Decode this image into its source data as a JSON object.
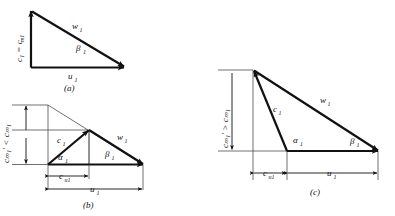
{
  "figure": {
    "stroke_color": "#111111",
    "ghost_color": "#333333",
    "background": "#ffffff"
  },
  "panels": [
    {
      "id": "a",
      "caption": "(a)",
      "labels": {
        "vertical": "c₁ = c",
        "vertical_sub": "m1",
        "relative_velocity": "w",
        "relative_velocity_sub": "1",
        "blade_speed": "u",
        "blade_speed_sub": "1",
        "relative_angle": "β",
        "relative_angle_sub": "1"
      }
    },
    {
      "id": "b",
      "caption": "(b)",
      "labels": {
        "vertical": "c",
        "vertical_sub_a": "m1",
        "vertical_prime": "′ <",
        "vertical_sub_b": "c",
        "vertical_sub_c": "m1",
        "inequality": "cₘ₁′ < cₘ₁",
        "absolute_velocity": "c",
        "absolute_velocity_sub": "1",
        "relative_velocity": "w",
        "relative_velocity_sub": "1",
        "blade_speed": "u",
        "blade_speed_sub": "1",
        "tangential": "c",
        "tangential_sub": "u1",
        "absolute_angle": "α",
        "absolute_angle_sub": "1",
        "relative_angle": "β",
        "relative_angle_sub": "1"
      }
    },
    {
      "id": "c",
      "caption": "(c)",
      "labels": {
        "inequality": "cₘ₁′ > cₘ₁",
        "absolute_velocity": "c",
        "absolute_velocity_sub": "1",
        "relative_velocity": "w",
        "relative_velocity_sub": "1",
        "blade_speed": "u",
        "blade_speed_sub": "1",
        "tangential": "c",
        "tangential_sub": "u1",
        "absolute_angle": "α",
        "absolute_angle_sub": "1",
        "relative_angle": "β",
        "relative_angle_sub": "1"
      }
    }
  ],
  "symbols": {
    "c": "c",
    "w": "w",
    "u": "u",
    "alpha": "α",
    "beta": "β",
    "prime": "′",
    "less_than": "<",
    "greater_than": ">",
    "equals": "=",
    "sub_1": "1",
    "sub_m1": "m1",
    "sub_u1": "u1"
  }
}
